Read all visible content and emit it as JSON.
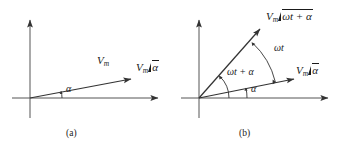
{
  "figure": {
    "type": "phasor-diagram",
    "background": "#ffffff",
    "stroke_color": "#333333",
    "text_color": "#1a1a1a",
    "panels": [
      {
        "id": "a",
        "caption": "(a)",
        "origin": [
          30,
          98
        ],
        "axes": {
          "x_axis_end": [
            160,
            98
          ],
          "y_axis_end": [
            30,
            18
          ],
          "arrowheads": [
            "x-positive",
            "y-positive"
          ]
        },
        "phasors": [
          {
            "name": "vm-alpha",
            "tip": [
              133,
              78
            ],
            "angle_deg": 12,
            "shaft_label": "Vm",
            "shaft_label_parts": {
              "base": "V",
              "sub": "m"
            },
            "tip_label_parts": {
              "base": "V",
              "sub": "m",
              "angle": "α"
            },
            "tip_label": "Vm ∠α"
          }
        ],
        "arcs": [
          {
            "name": "alpha",
            "label": "α",
            "from_deg": 0,
            "to_deg": 12,
            "radius": 30
          }
        ]
      },
      {
        "id": "b",
        "caption": "(b)",
        "origin": [
          199,
          98
        ],
        "axes": {
          "x_axis_end": [
            330,
            98
          ],
          "y_axis_end": [
            199,
            18
          ],
          "arrowheads": [
            "x-positive",
            "y-positive"
          ]
        },
        "phasors": [
          {
            "name": "vm-alpha",
            "tip": [
              296,
              78
            ],
            "angle_deg": 12,
            "shaft_label": "",
            "tip_label_parts": {
              "base": "V",
              "sub": "m",
              "angle": "α"
            },
            "tip_label": "Vm ∠α"
          },
          {
            "name": "vm-omega-t-plus-alpha",
            "tip": [
              262,
              27
            ],
            "angle_deg": 46,
            "shaft_label": "",
            "tip_label_parts": {
              "base": "V",
              "sub": "m",
              "angle": "ωt + α"
            },
            "tip_label": "Vm ∠ωt + α"
          }
        ],
        "arcs": [
          {
            "name": "alpha",
            "label": "α",
            "from_deg": 0,
            "to_deg": 12,
            "radius": 48
          },
          {
            "name": "omega-t-plus-alpha",
            "label": "ωt + α",
            "from_deg": 0,
            "to_deg": 46,
            "radius": 30
          },
          {
            "name": "omega-t",
            "label": "ωt",
            "from_deg": 12,
            "to_deg": 46,
            "radius": 78
          }
        ]
      }
    ]
  },
  "labels": {
    "panel_a": {
      "shaft_v": "V",
      "shaft_sub": "m",
      "tip_v": "V",
      "tip_sub": "m",
      "tip_angle": "α",
      "arc_alpha": "α",
      "caption": "(a)"
    },
    "panel_b": {
      "top_v": "V",
      "top_sub": "m",
      "top_angle": "ωt + α",
      "right_v": "V",
      "right_sub": "m",
      "right_angle": "α",
      "arc_omega_t": "ωt",
      "arc_omega_t_alpha": "ωt + α",
      "arc_alpha": "α",
      "caption": "(b)"
    }
  }
}
